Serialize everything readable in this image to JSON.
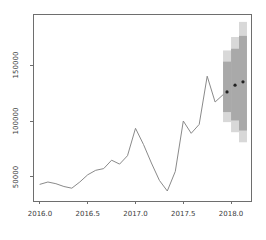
{
  "window": {
    "width": 266,
    "height": 240,
    "background": "#ffffff"
  },
  "chart_data": {
    "type": "line",
    "title": "",
    "xlabel": "",
    "ylabel": "",
    "grid": false,
    "legend": null,
    "x_ticks": {
      "values": [
        2016.0,
        2016.5,
        2017.0,
        2017.5,
        2018.0
      ],
      "labels": [
        "2016.0",
        "2016.5",
        "2017.0",
        "2017.5",
        "2018.0"
      ]
    },
    "y_ticks": {
      "values": [
        50000,
        100000,
        150000
      ],
      "labels": [
        "50000",
        "100000",
        "150000"
      ]
    },
    "xlim": [
      2015.927,
      2018.209
    ],
    "ylim": [
      28570,
      195540
    ],
    "series": [
      {
        "name": "observed",
        "type": "line",
        "color": "#8a8a8a",
        "start": 2016.0,
        "frequency": 12,
        "values": [
          43500,
          45500,
          44000,
          41500,
          40000,
          45500,
          52000,
          56000,
          57500,
          65000,
          61500,
          69000,
          93500,
          79000,
          62500,
          47000,
          37500,
          55000,
          100000,
          89000,
          97000,
          140000,
          117000,
          123500
        ]
      }
    ],
    "forecast": {
      "x": [
        2017.958,
        2018.042,
        2018.125
      ],
      "mean": [
        126000,
        132000,
        135000
      ],
      "lo80": [
        108000,
        100500,
        91500
      ],
      "hi80": [
        153000,
        164500,
        176000
      ],
      "lo95": [
        99000,
        90000,
        81000
      ],
      "hi95": [
        163000,
        175000,
        188500
      ],
      "step_width_years": 0.0833,
      "point_color": "#222222",
      "band80_color": "#a9a9a9",
      "band95_color": "#d8d8d8"
    },
    "axis_color": "#6e6e6e",
    "tick_label_color": "#3c3c3c",
    "tick_label_font_px": 7
  }
}
